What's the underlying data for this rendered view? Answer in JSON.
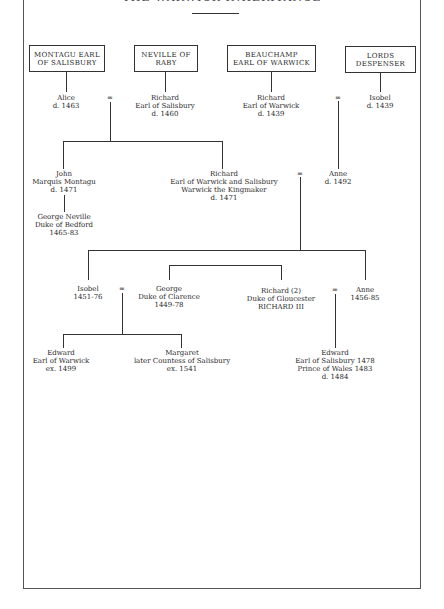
{
  "title": "THE WARWICK INHERITANCE",
  "houses": [
    {
      "line1": "MONTAGU EARL",
      "line2": "OF SALISBURY"
    },
    {
      "line1": "NEVILLE OF",
      "line2": "RABY"
    },
    {
      "line1": "BEAUCHAMP",
      "line2": "EARL OF WARWICK"
    },
    {
      "line1": "LORDS",
      "line2": "DESPENSER"
    }
  ],
  "people": {
    "alice": [
      "Alice",
      "d. 1463"
    ],
    "richard_salisbury": [
      "Richard",
      "Earl of Salisbury",
      "d. 1460"
    ],
    "richard_warwick": [
      "Richard",
      "Earl of Warwick",
      "d. 1439"
    ],
    "isobel_despenser": [
      "Isobel",
      "d. 1439"
    ],
    "john": [
      "John",
      "Marquis Montagu",
      "d. 1471"
    ],
    "kingmaker": [
      "Richard",
      "Earl of Warwick and Salisbury",
      "Warwick the Kingmaker",
      "d. 1471"
    ],
    "anne_beauchamp": [
      "Anne",
      "d. 1492"
    ],
    "george_neville": [
      "George Neville",
      "Duke of Bedford",
      "1465-83"
    ],
    "isobel": [
      "Isobel",
      "1451-76"
    ],
    "george": [
      "George",
      "Duke of Clarence",
      "1449-78"
    ],
    "richard_gloucester": [
      "Richard (2)",
      "Duke of Gloucester",
      "RICHARD III"
    ],
    "anne": [
      "Anne",
      "1456-85"
    ],
    "edward_warwick": [
      "Edward",
      "Earl of Warwick",
      "ex. 1499"
    ],
    "margaret": [
      "Margaret",
      "later Countess of Salisbury",
      "ex. 1541"
    ],
    "edward_prince": [
      "Edward",
      "Earl of Salisbury 1478",
      "Prince of Wales 1483",
      "d. 1484"
    ]
  },
  "marriage_symbol": "="
}
